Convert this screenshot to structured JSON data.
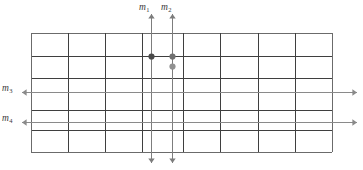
{
  "figure": {
    "background_color": "#ffffff",
    "grid": {
      "left": 31,
      "top": 33,
      "right": 332,
      "bottom": 152,
      "border_color": "#6b6b6b",
      "line_color": "#3f3f3f",
      "light_line_color": "#9a9a9a",
      "border_width": 1,
      "column_count": 8,
      "row_count": 6,
      "column_x": [
        31,
        68,
        105,
        142,
        183,
        220,
        258,
        295,
        332
      ],
      "row_y": [
        33,
        56,
        78,
        92,
        110,
        130,
        152
      ]
    },
    "marked_lines": [
      {
        "id": "m1",
        "label": "m",
        "subscript": "1",
        "orientation": "vertical",
        "position": 151,
        "color": "#7d7d7d",
        "extends_from": 14,
        "extends_to": 163,
        "arrow_start": true,
        "arrow_end": true,
        "label_x": 139,
        "label_y": 3
      },
      {
        "id": "m2",
        "label": "m",
        "subscript": "2",
        "orientation": "vertical",
        "position": 172,
        "color": "#7d7d7d",
        "extends_from": 14,
        "extends_to": 163,
        "arrow_start": true,
        "arrow_end": true,
        "label_x": 161,
        "label_y": 3
      },
      {
        "id": "m3",
        "label": "m",
        "subscript": "3",
        "orientation": "horizontal",
        "position": 92,
        "color": "#8a8a8a",
        "extends_from": 22,
        "extends_to": 357,
        "arrow_start": true,
        "arrow_end": true,
        "label_x": 2,
        "label_y": 84
      },
      {
        "id": "m4",
        "label": "m",
        "subscript": "4",
        "orientation": "horizontal",
        "position": 122,
        "color": "#8a8a8a",
        "extends_from": 22,
        "extends_to": 357,
        "arrow_start": true,
        "arrow_end": true,
        "label_x": 2,
        "label_y": 114
      }
    ],
    "points": [
      {
        "id": "point-m1-intersection",
        "x": 151,
        "y": 56,
        "radius": 3.1,
        "color": "#4a4a4a"
      },
      {
        "id": "point-m2-intersection",
        "x": 172,
        "y": 56,
        "radius": 3.1,
        "color": "#707070"
      },
      {
        "id": "point-m2-lower",
        "x": 172,
        "y": 66,
        "radius": 3.1,
        "color": "#919191"
      }
    ]
  }
}
